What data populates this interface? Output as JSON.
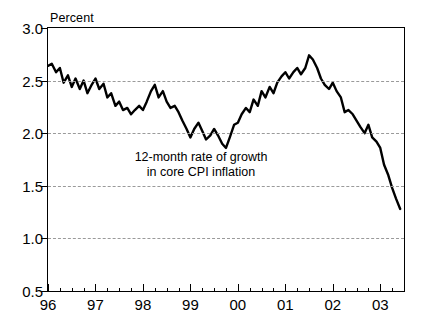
{
  "chart_data": {
    "type": "line",
    "title": "",
    "xlabel": "",
    "ylabel": "Percent",
    "unit_label": "Percent",
    "ylim": [
      0.5,
      3.0
    ],
    "ytick_values": [
      0.5,
      1.0,
      1.5,
      2.0,
      2.5,
      3.0
    ],
    "ytick_labels": [
      "0.5",
      "1.0",
      "1.5",
      "2.0",
      "2.5",
      "3.0"
    ],
    "grid": "horizontal-dashed",
    "legend": "none",
    "xlim": [
      1996.0,
      2003.5
    ],
    "xtick_labels": [
      "96",
      "97",
      "98",
      "99",
      "00",
      "01",
      "02",
      "03"
    ],
    "xtick_values": [
      1996,
      1997,
      1998,
      1999,
      2000,
      2001,
      2002,
      2003
    ],
    "minor_ticks_per_interval": 3,
    "line_color": "#000000",
    "line_width": 2.4,
    "annotations": [
      {
        "text_line1": "12-month rate of growth",
        "text_line2": "in core CPI inflation",
        "x": 1998.6,
        "y": 1.62
      }
    ],
    "series": [
      {
        "name": "12-month rate of growth in core CPI inflation",
        "x": [
          1996.0,
          1996.08,
          1996.17,
          1996.25,
          1996.33,
          1996.42,
          1996.5,
          1996.58,
          1996.67,
          1996.75,
          1996.83,
          1996.92,
          1997.0,
          1997.08,
          1997.17,
          1997.25,
          1997.33,
          1997.42,
          1997.5,
          1997.58,
          1997.67,
          1997.75,
          1997.83,
          1997.92,
          1998.0,
          1998.08,
          1998.17,
          1998.25,
          1998.33,
          1998.42,
          1998.5,
          1998.58,
          1998.67,
          1998.75,
          1998.83,
          1998.92,
          1999.0,
          1999.08,
          1999.17,
          1999.25,
          1999.33,
          1999.42,
          1999.5,
          1999.58,
          1999.67,
          1999.75,
          1999.83,
          1999.92,
          2000.0,
          2000.08,
          2000.17,
          2000.25,
          2000.33,
          2000.42,
          2000.5,
          2000.58,
          2000.67,
          2000.75,
          2000.83,
          2000.92,
          2001.0,
          2001.08,
          2001.17,
          2001.25,
          2001.33,
          2001.42,
          2001.5,
          2001.58,
          2001.67,
          2001.75,
          2001.83,
          2001.92,
          2002.0,
          2002.08,
          2002.17,
          2002.25,
          2002.33,
          2002.42,
          2002.5,
          2002.58,
          2002.67,
          2002.75,
          2002.83,
          2002.92,
          2003.0,
          2003.08,
          2003.17,
          2003.25,
          2003.33,
          2003.42
        ],
        "values": [
          2.64,
          2.66,
          2.58,
          2.62,
          2.48,
          2.55,
          2.44,
          2.52,
          2.42,
          2.5,
          2.38,
          2.46,
          2.52,
          2.42,
          2.47,
          2.34,
          2.38,
          2.26,
          2.3,
          2.22,
          2.24,
          2.18,
          2.22,
          2.26,
          2.22,
          2.3,
          2.4,
          2.46,
          2.34,
          2.4,
          2.3,
          2.24,
          2.26,
          2.2,
          2.12,
          2.04,
          1.96,
          2.04,
          2.1,
          2.02,
          1.94,
          1.98,
          2.04,
          1.98,
          1.9,
          1.86,
          1.96,
          2.08,
          2.1,
          2.18,
          2.24,
          2.2,
          2.32,
          2.26,
          2.4,
          2.34,
          2.44,
          2.38,
          2.48,
          2.54,
          2.58,
          2.52,
          2.58,
          2.62,
          2.56,
          2.62,
          2.74,
          2.7,
          2.62,
          2.52,
          2.46,
          2.42,
          2.48,
          2.4,
          2.34,
          2.2,
          2.22,
          2.18,
          2.12,
          2.06,
          2.0,
          2.08,
          1.96,
          1.92,
          1.86,
          1.7,
          1.6,
          1.48,
          1.38,
          1.28
        ]
      }
    ]
  }
}
